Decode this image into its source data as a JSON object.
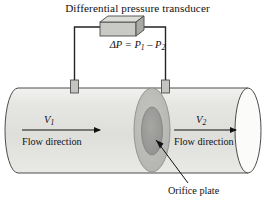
{
  "figure": {
    "title": "Differential pressure transducer",
    "equation": {
      "lead": "ΔP = P",
      "sub1": "1",
      "minus": " – P",
      "sub2": "2"
    },
    "velocity_upstream": {
      "symbol": "V",
      "sub": "1"
    },
    "velocity_downstream": {
      "symbol": "V",
      "sub": "2"
    },
    "flow_direction_upstream": "Flow direction",
    "flow_direction_downstream": "Flow direction",
    "orifice_label": "Orifice plate",
    "colors": {
      "pipe_body": "#e0e0dd",
      "pipe_body_light": "#f0f0ee",
      "pipe_edge": "#555555",
      "orifice_plate": "#b9b9b6",
      "orifice_hole": "#9a9a97",
      "transducer_front": "#c9c9c6",
      "transducer_top": "#dcdcd9",
      "transducer_side": "#a8a8a5",
      "tap_fill": "#c4c4c1",
      "wire": "#2a2a2a",
      "arrow": "#111111",
      "text": "#111111"
    }
  }
}
